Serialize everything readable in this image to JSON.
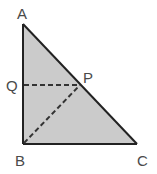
{
  "diagram": {
    "type": "geometry",
    "shape": "right triangle",
    "fill_color": "#cbcbcb",
    "stroke_color": "#222222",
    "dashed_color": "#333333",
    "points": {
      "A": {
        "label": "A",
        "x": 23,
        "y": 24
      },
      "B": {
        "label": "B",
        "x": 23,
        "y": 144
      },
      "C": {
        "label": "C",
        "x": 137,
        "y": 144
      },
      "P": {
        "label": "P",
        "x": 80,
        "y": 85
      },
      "Q": {
        "label": "Q",
        "x": 23,
        "y": 85
      }
    },
    "segments": [
      {
        "from": "A",
        "to": "B",
        "style": "solid"
      },
      {
        "from": "B",
        "to": "C",
        "style": "solid"
      },
      {
        "from": "A",
        "to": "C",
        "style": "solid"
      },
      {
        "from": "Q",
        "to": "P",
        "style": "dashed"
      },
      {
        "from": "B",
        "to": "P",
        "style": "dashed"
      }
    ]
  }
}
